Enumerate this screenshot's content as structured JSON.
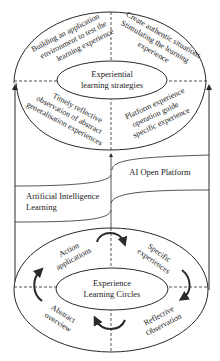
{
  "diagram": {
    "top_cycle": {
      "center_label_line1": "Experiential",
      "center_label_line2": "learning strategies",
      "quadrants": {
        "top_left": [
          "Building an application",
          "environment to test the",
          "learning experience"
        ],
        "top_right": [
          "Create authentic situations",
          "Stimulating the learning",
          "experience"
        ],
        "bottom_left": [
          "Timely reflective",
          "observation of abstract",
          "generalisation experiences"
        ],
        "bottom_right": [
          "Platform experience",
          "operation guide",
          "specific experience"
        ]
      }
    },
    "middle_layers": {
      "upper_band_label": "AI Open Platform",
      "lower_band_label_line1": "Artificial Intelligence",
      "lower_band_label_line2": "Learning"
    },
    "bottom_cycle": {
      "center_label_line1": "Experience",
      "center_label_line2": "Learning Circles",
      "quadrants": {
        "top_left": [
          "Action",
          "applications"
        ],
        "top_right": [
          "Specific",
          "experiences"
        ],
        "bottom_left": [
          "Abstract",
          "overview"
        ],
        "bottom_right": [
          "Reflective",
          "Observation"
        ]
      }
    },
    "colors": {
      "stroke": "#2a2a2a",
      "text": "#222222",
      "background": "#ffffff"
    }
  }
}
